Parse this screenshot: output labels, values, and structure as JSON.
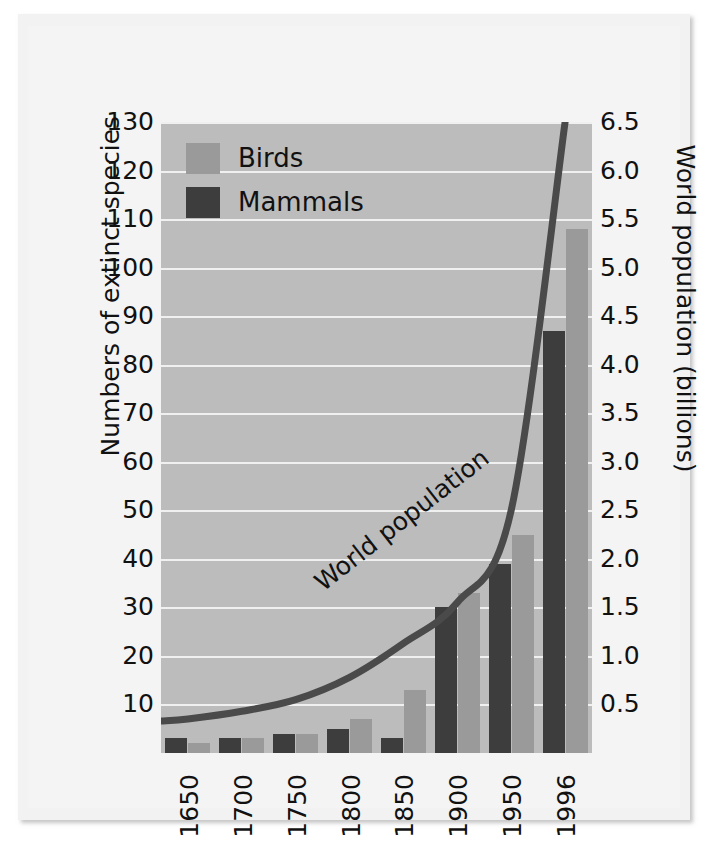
{
  "chart_data": {
    "type": "bar",
    "title": "",
    "subtitle": "",
    "xlabel": "",
    "ylabel": "Numbers of extinct species",
    "y2label": "World population (billions)",
    "categories": [
      "1650",
      "1700",
      "1750",
      "1800",
      "1850",
      "1900",
      "1950",
      "1996"
    ],
    "ylim": [
      0,
      130
    ],
    "yticks": [
      130,
      120,
      110,
      100,
      90,
      80,
      70,
      60,
      50,
      40,
      30,
      20,
      10
    ],
    "y2lim": [
      0,
      6.5
    ],
    "y2ticks": [
      "6.5",
      "6.0",
      "5.5",
      "5.0",
      "4.5",
      "4.0",
      "3.5",
      "3.0",
      "2.5",
      "2.0",
      "1.5",
      "1.0",
      "0.5"
    ],
    "grid": true,
    "legend_position": "top-left",
    "series": [
      {
        "name": "Mammals",
        "axis": "left",
        "color": "#3d3d3d",
        "values": [
          3,
          3,
          4,
          5,
          3,
          30,
          39,
          87
        ]
      },
      {
        "name": "Birds",
        "axis": "left",
        "color": "#9a9a9a",
        "values": [
          2,
          3,
          4,
          7,
          13,
          33,
          45,
          108
        ]
      }
    ],
    "line_series": {
      "name": "World population",
      "axis": "right",
      "color": "#4a4a4a",
      "x": [
        "1650",
        "1700",
        "1750",
        "1800",
        "1850",
        "1900",
        "1950",
        "1996"
      ],
      "values": [
        0.35,
        0.43,
        0.55,
        0.78,
        1.13,
        1.55,
        2.5,
        6.5
      ],
      "annotation": "World population"
    },
    "annotations": [
      "World population"
    ]
  },
  "legend": {
    "items": [
      {
        "label": "Birds",
        "color": "#9a9a9a"
      },
      {
        "label": "Mammals",
        "color": "#3d3d3d"
      }
    ]
  },
  "axes": {
    "left_title": "Numbers of extinct species",
    "right_title": "World population (billions)"
  },
  "colors": {
    "plot_background": "#bcbcbc",
    "panel_background": "#f4f4f4",
    "gridline": "#f0f0f0",
    "birds": "#9a9a9a",
    "mammals": "#3d3d3d",
    "curve": "#4a4a4a",
    "text": "#111111"
  }
}
